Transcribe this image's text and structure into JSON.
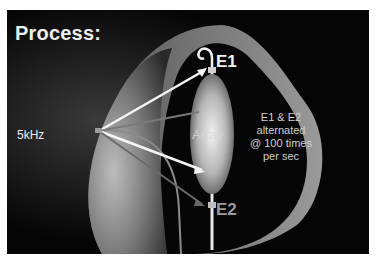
{
  "slide": {
    "title": "Process:",
    "labels": {
      "electrode_1": "E1",
      "electrode_2": "E2",
      "frequency": "5kHz",
      "balloon": "Array",
      "note_lines": [
        "E1 & E2",
        "alternated",
        "@ 100 times",
        "per sec"
      ]
    },
    "colors": {
      "background": "#050505",
      "e1_label": "#f2f2f2",
      "e2_label": "#9a9a9a",
      "arrow_white": "#f5f5f5",
      "arrow_gray": "#7a7a7a"
    }
  }
}
